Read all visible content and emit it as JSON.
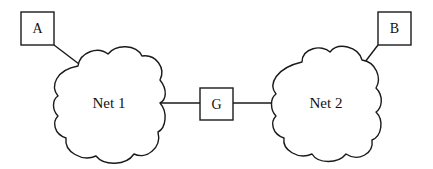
{
  "diagram": {
    "type": "network-topology",
    "hosts": [
      {
        "id": "A",
        "label": "A"
      },
      {
        "id": "B",
        "label": "B"
      }
    ],
    "gateway": {
      "id": "G",
      "label": "G"
    },
    "networks": [
      {
        "id": "net1",
        "label": "Net 1"
      },
      {
        "id": "net2",
        "label": "Net 2"
      }
    ],
    "edges": [
      {
        "from": "A",
        "to": "net1"
      },
      {
        "from": "net1",
        "to": "G"
      },
      {
        "from": "G",
        "to": "net2"
      },
      {
        "from": "B",
        "to": "net2"
      }
    ],
    "colors": {
      "stroke": "#1a1a1a",
      "background": "#ffffff"
    }
  }
}
